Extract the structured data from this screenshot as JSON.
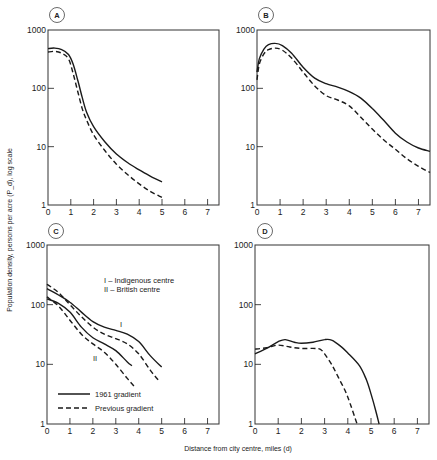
{
  "figure": {
    "ylabel": "Population density, persons per acre (P_d), log scale",
    "xlabel": "Distance from city centre, miles (d)"
  },
  "legend": {
    "solid": "1961 gradient",
    "dashed": "Previous gradient",
    "centre_I": "I  – Indigenous centre",
    "centre_II": "II – British centre",
    "curve_label_I": "I",
    "curve_label_II": "II"
  },
  "chart_data": [
    {
      "panel": "A",
      "type": "line",
      "yscale": "log",
      "ylim": [
        1,
        1000
      ],
      "xlim": [
        0,
        7.5
      ],
      "yticks": [
        "1",
        "10",
        "100",
        "1000"
      ],
      "xticks": [
        "0",
        "1",
        "2",
        "3",
        "4",
        "5",
        "6",
        "7"
      ],
      "series": [
        {
          "name": "1961 gradient",
          "style": "solid",
          "x": [
            0,
            0.3,
            0.6,
            0.9,
            1.1,
            1.3,
            1.5,
            1.7,
            2.0,
            2.5,
            3.0,
            3.5,
            4.0,
            4.5,
            5.0
          ],
          "y": [
            480,
            490,
            460,
            380,
            260,
            140,
            70,
            38,
            22,
            12,
            7.5,
            5.3,
            4.0,
            3.1,
            2.5
          ]
        },
        {
          "name": "Previous gradient",
          "style": "dashed",
          "x": [
            0,
            0.3,
            0.6,
            0.9,
            1.1,
            1.3,
            1.5,
            1.7,
            2.0,
            2.5,
            3.0,
            3.5,
            4.0,
            4.5,
            5.0
          ],
          "y": [
            420,
            430,
            400,
            320,
            180,
            90,
            45,
            28,
            16,
            8.5,
            5.0,
            3.3,
            2.3,
            1.7,
            1.35
          ]
        }
      ]
    },
    {
      "panel": "B",
      "type": "line",
      "yscale": "log",
      "ylim": [
        1,
        1000
      ],
      "xlim": [
        0,
        7.5
      ],
      "yticks": [
        "1",
        "10",
        "100",
        "1000"
      ],
      "xticks": [
        "0",
        "1",
        "2",
        "3",
        "4",
        "5",
        "6",
        "7"
      ],
      "series": [
        {
          "name": "1961 gradient",
          "style": "solid",
          "x": [
            0,
            0.1,
            0.3,
            0.5,
            0.8,
            1.1,
            1.5,
            2.0,
            2.5,
            3.0,
            3.5,
            4.0,
            4.5,
            5.0,
            5.5,
            6.0,
            6.5,
            7.0,
            7.5
          ],
          "y": [
            190,
            320,
            470,
            560,
            590,
            540,
            400,
            230,
            150,
            120,
            105,
            88,
            68,
            45,
            28,
            17,
            12,
            9.5,
            8.3
          ]
        },
        {
          "name": "Previous gradient",
          "style": "dashed",
          "x": [
            0,
            0.1,
            0.3,
            0.5,
            0.8,
            1.1,
            1.5,
            2.0,
            2.5,
            3.0,
            3.5,
            4.0,
            4.5,
            5.0,
            5.5,
            6.0,
            6.5,
            7.0,
            7.5
          ],
          "y": [
            140,
            260,
            390,
            460,
            490,
            450,
            330,
            190,
            110,
            75,
            63,
            50,
            32,
            20,
            13,
            9,
            6.2,
            4.6,
            3.6
          ]
        }
      ]
    },
    {
      "panel": "C",
      "type": "line",
      "yscale": "log",
      "ylim": [
        1,
        1000
      ],
      "xlim": [
        0,
        7.5
      ],
      "yticks": [
        "1",
        "10",
        "100",
        "1000"
      ],
      "xticks": [
        "0",
        "1",
        "2",
        "3",
        "4",
        "5",
        "6",
        "7"
      ],
      "series": [
        {
          "name": "1961 gradient (I Indigenous centre)",
          "style": "solid",
          "x": [
            0,
            0.5,
            1.0,
            1.5,
            2.0,
            2.5,
            3.0,
            3.5,
            4.0,
            4.5,
            5.0
          ],
          "y": [
            185,
            145,
            110,
            75,
            52,
            42,
            37,
            32,
            24,
            14,
            9
          ]
        },
        {
          "name": "Previous gradient (I Indigenous centre)",
          "style": "dashed",
          "x": [
            0,
            0.5,
            1.0,
            1.5,
            2.0,
            2.5,
            3.0,
            3.5,
            4.0,
            4.5,
            4.9
          ],
          "y": [
            220,
            160,
            100,
            63,
            42,
            32,
            27,
            22,
            15,
            8,
            5.2
          ]
        },
        {
          "name": "1961 gradient (II British centre)",
          "style": "solid",
          "x": [
            0,
            0.5,
            1.0,
            1.5,
            2.0,
            2.5,
            3.0,
            3.5,
            3.7
          ],
          "y": [
            125,
            105,
            75,
            42,
            28,
            22,
            17,
            11,
            9.5
          ]
        },
        {
          "name": "Previous gradient (II British centre)",
          "style": "dashed",
          "x": [
            0,
            0.5,
            1.0,
            1.5,
            2.0,
            2.5,
            3.0,
            3.5,
            3.8
          ],
          "y": [
            135,
            95,
            55,
            32,
            22,
            16,
            10,
            5.8,
            4.3
          ]
        }
      ]
    },
    {
      "panel": "D",
      "type": "line",
      "yscale": "log",
      "ylim": [
        1,
        1000
      ],
      "xlim": [
        0,
        7.5
      ],
      "yticks": [
        "1",
        "10",
        "100",
        "1000"
      ],
      "xticks": [
        "0",
        "1",
        "2",
        "3",
        "4",
        "5",
        "6",
        "7"
      ],
      "series": [
        {
          "name": "1961 gradient",
          "style": "solid",
          "x": [
            0,
            0.5,
            1.0,
            1.3,
            1.7,
            2.0,
            2.5,
            3.0,
            3.3,
            3.7,
            4.0,
            4.5,
            4.8,
            5.0,
            5.2,
            5.35
          ],
          "y": [
            15,
            18.5,
            24,
            26,
            23.5,
            22.5,
            23.5,
            26,
            25.5,
            20,
            15.5,
            9.5,
            5.5,
            3.2,
            1.7,
            1.0
          ]
        },
        {
          "name": "Previous gradient",
          "style": "dashed",
          "x": [
            0,
            0.5,
            1.0,
            1.5,
            2.0,
            2.5,
            2.8,
            3.0,
            3.3,
            3.6,
            3.9,
            4.1,
            4.3,
            4.4
          ],
          "y": [
            18,
            19,
            21,
            19.5,
            18.5,
            18.5,
            18,
            15,
            10,
            6,
            3.5,
            2.2,
            1.3,
            1.0
          ]
        }
      ]
    }
  ],
  "panels": [
    {
      "letter": "A"
    },
    {
      "letter": "B"
    },
    {
      "letter": "C"
    },
    {
      "letter": "D"
    }
  ],
  "colors": {
    "ink": "#1a1a1a",
    "frame": "#333333"
  }
}
